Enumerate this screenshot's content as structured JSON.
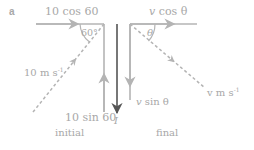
{
  "figure": {
    "part_label": "a",
    "colors": {
      "line": "#b4b4b4",
      "impulse": "#555555",
      "text": "#a8a8a8"
    },
    "initial": {
      "caption": "initial",
      "horizontal_component": "10 cos 60",
      "vertical_component": "10 sin 60",
      "resultant": {
        "value": "10 m s",
        "exp": "-1"
      },
      "angle": "60°"
    },
    "final": {
      "caption": "final",
      "horizontal_component": {
        "v": "v",
        "rest": " cos θ"
      },
      "vertical_component": {
        "v": "v",
        "rest": " sin θ"
      },
      "resultant": {
        "v": "v",
        "unit": " m s",
        "exp": "-1"
      },
      "angle": "θ"
    },
    "impulse": {
      "label": "I"
    }
  }
}
